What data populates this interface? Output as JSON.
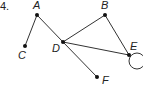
{
  "problem_number": "4.",
  "graph": {
    "vertices": [
      {
        "id": "A",
        "label": "A",
        "x": 37,
        "y": 15,
        "lx": 33,
        "ly": 9
      },
      {
        "id": "B",
        "label": "B",
        "x": 105,
        "y": 15,
        "lx": 101,
        "ly": 9
      },
      {
        "id": "C",
        "label": "C",
        "x": 25,
        "y": 46,
        "lx": 18,
        "ly": 59
      },
      {
        "id": "D",
        "label": "D",
        "x": 63,
        "y": 42,
        "lx": 52,
        "ly": 52
      },
      {
        "id": "E",
        "label": "E",
        "x": 129,
        "y": 55,
        "lx": 130,
        "ly": 50
      },
      {
        "id": "F",
        "label": "F",
        "x": 97,
        "y": 77,
        "lx": 102,
        "ly": 84
      }
    ],
    "edges": [
      [
        "A",
        "C"
      ],
      [
        "A",
        "D"
      ],
      [
        "D",
        "F"
      ],
      [
        "D",
        "B"
      ],
      [
        "D",
        "E"
      ],
      [
        "B",
        "E"
      ]
    ],
    "loops": [
      {
        "vertex": "E",
        "cx": 137,
        "cy": 61,
        "r": 8
      }
    ]
  },
  "colors": {
    "stroke": "#333333",
    "vertex": "#111111",
    "text": "#222222"
  }
}
